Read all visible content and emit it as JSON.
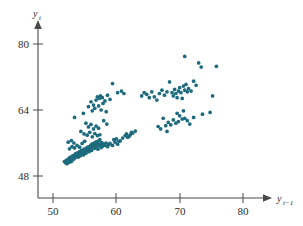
{
  "figure": {
    "background_color": "#ffffff",
    "marker_color": "#1d6b7d",
    "axis_color": "#4a4a4a",
    "text_color": "#2b2b2b"
  },
  "axes": {
    "y_title_base": "y",
    "y_title_sub": "t",
    "x_title_base": "y",
    "x_title_sub": "t−1",
    "x_ticks": [
      "50",
      "60",
      "70",
      "80"
    ],
    "y_ticks": [
      "80",
      "64",
      "48"
    ]
  },
  "chart_data": {
    "type": "scatter",
    "title": "",
    "xlabel": "y_{t-1}",
    "ylabel": "y_t",
    "xlim": [
      46,
      84
    ],
    "ylim": [
      42,
      84
    ],
    "xticks": [
      50,
      60,
      70,
      80
    ],
    "yticks": [
      48,
      64,
      80
    ],
    "grid": false,
    "legend": null,
    "marker_color": "#1d6b7d",
    "marker_size": 3,
    "n_points": 175,
    "series": [
      {
        "name": "lag-1 scatter",
        "points": [
          [
            51.8,
            51.5
          ],
          [
            52.0,
            51.2
          ],
          [
            52.1,
            51.8
          ],
          [
            52.2,
            51.0
          ],
          [
            52.3,
            51.6
          ],
          [
            52.4,
            52.1
          ],
          [
            52.5,
            51.3
          ],
          [
            52.6,
            52.4
          ],
          [
            52.7,
            51.9
          ],
          [
            52.8,
            52.6
          ],
          [
            52.9,
            51.5
          ],
          [
            53.0,
            52.2
          ],
          [
            53.1,
            52.9
          ],
          [
            53.2,
            52.0
          ],
          [
            53.3,
            52.7
          ],
          [
            53.4,
            53.1
          ],
          [
            53.5,
            52.4
          ],
          [
            53.6,
            53.4
          ],
          [
            53.7,
            52.8
          ],
          [
            53.8,
            53.0
          ],
          [
            53.9,
            53.6
          ],
          [
            54.0,
            52.6
          ],
          [
            54.1,
            53.3
          ],
          [
            54.2,
            53.9
          ],
          [
            54.3,
            52.9
          ],
          [
            54.4,
            53.7
          ],
          [
            54.5,
            54.2
          ],
          [
            54.6,
            53.4
          ],
          [
            54.7,
            54.0
          ],
          [
            54.8,
            53.1
          ],
          [
            54.9,
            54.5
          ],
          [
            55.0,
            53.8
          ],
          [
            55.1,
            54.3
          ],
          [
            55.2,
            53.5
          ],
          [
            55.3,
            54.8
          ],
          [
            55.4,
            54.1
          ],
          [
            55.5,
            55.0
          ],
          [
            55.6,
            54.4
          ],
          [
            55.7,
            53.9
          ],
          [
            55.8,
            55.2
          ],
          [
            55.9,
            54.6
          ],
          [
            56.0,
            55.5
          ],
          [
            56.1,
            54.2
          ],
          [
            56.2,
            55.8
          ],
          [
            56.3,
            54.9
          ],
          [
            56.4,
            55.3
          ],
          [
            56.5,
            56.0
          ],
          [
            56.6,
            54.7
          ],
          [
            56.7,
            55.6
          ],
          [
            56.8,
            56.3
          ],
          [
            56.9,
            55.1
          ],
          [
            57.0,
            55.9
          ],
          [
            57.1,
            54.5
          ],
          [
            57.2,
            56.5
          ],
          [
            57.3,
            55.4
          ],
          [
            57.4,
            56.8
          ],
          [
            57.5,
            55.7
          ],
          [
            57.6,
            54.9
          ],
          [
            57.7,
            56.1
          ],
          [
            57.8,
            55.2
          ],
          [
            58.0,
            55.8
          ],
          [
            58.2,
            55.4
          ],
          [
            58.4,
            56.0
          ],
          [
            58.6,
            55.1
          ],
          [
            58.8,
            55.6
          ],
          [
            52.6,
            54.6
          ],
          [
            53.0,
            55.1
          ],
          [
            53.4,
            54.8
          ],
          [
            53.8,
            55.4
          ],
          [
            54.2,
            55.0
          ],
          [
            52.4,
            56.2
          ],
          [
            52.9,
            56.6
          ],
          [
            53.3,
            56.0
          ],
          [
            54.6,
            55.9
          ],
          [
            55.0,
            56.4
          ],
          [
            54.4,
            58.8
          ],
          [
            54.9,
            58.2
          ],
          [
            55.4,
            57.9
          ],
          [
            55.8,
            58.6
          ],
          [
            56.2,
            57.5
          ],
          [
            56.6,
            58.3
          ],
          [
            57.0,
            57.8
          ],
          [
            53.4,
            62.2
          ],
          [
            55.6,
            59.9
          ],
          [
            56.0,
            60.5
          ],
          [
            56.4,
            59.4
          ],
          [
            56.8,
            60.1
          ],
          [
            57.2,
            59.6
          ],
          [
            55.2,
            60.8
          ],
          [
            57.4,
            58.0
          ],
          [
            54.8,
            63.2
          ],
          [
            55.6,
            64.8
          ],
          [
            56.0,
            66.0
          ],
          [
            56.4,
            65.2
          ],
          [
            56.8,
            66.4
          ],
          [
            57.0,
            67.2
          ],
          [
            57.3,
            66.8
          ],
          [
            57.5,
            67.4
          ],
          [
            57.8,
            67.0
          ],
          [
            56.2,
            63.8
          ],
          [
            56.6,
            64.4
          ],
          [
            57.2,
            65.0
          ],
          [
            57.6,
            64.0
          ],
          [
            57.9,
            65.6
          ],
          [
            58.2,
            66.2
          ],
          [
            58.4,
            63.6
          ],
          [
            58.6,
            67.6
          ],
          [
            59.0,
            66.6
          ],
          [
            59.4,
            70.4
          ],
          [
            60.2,
            68.2
          ],
          [
            60.8,
            68.6
          ],
          [
            61.2,
            68.0
          ],
          [
            58.0,
            61.4
          ],
          [
            58.5,
            60.6
          ],
          [
            59.0,
            55.9
          ],
          [
            59.4,
            55.4
          ],
          [
            59.8,
            56.2
          ],
          [
            60.2,
            55.7
          ],
          [
            60.6,
            56.5
          ],
          [
            61.0,
            57.2
          ],
          [
            61.4,
            57.8
          ],
          [
            61.8,
            57.4
          ],
          [
            62.2,
            58.0
          ],
          [
            62.6,
            58.4
          ],
          [
            63.0,
            58.9
          ],
          [
            59.6,
            56.8
          ],
          [
            60.0,
            57.0
          ],
          [
            60.4,
            56.4
          ],
          [
            61.6,
            58.2
          ],
          [
            62.0,
            57.6
          ],
          [
            62.4,
            58.6
          ],
          [
            64.0,
            67.4
          ],
          [
            64.4,
            68.2
          ],
          [
            64.8,
            67.8
          ],
          [
            65.2,
            67.0
          ],
          [
            65.6,
            68.4
          ],
          [
            66.0,
            67.2
          ],
          [
            66.4,
            66.4
          ],
          [
            66.8,
            68.0
          ],
          [
            67.2,
            68.8
          ],
          [
            67.6,
            67.6
          ],
          [
            68.0,
            68.4
          ],
          [
            68.4,
            70.8
          ],
          [
            68.8,
            68.2
          ],
          [
            69.0,
            67.4
          ],
          [
            69.2,
            69.0
          ],
          [
            69.4,
            68.0
          ],
          [
            69.6,
            67.0
          ],
          [
            69.8,
            68.6
          ],
          [
            70.0,
            69.4
          ],
          [
            70.2,
            68.2
          ],
          [
            70.4,
            66.8
          ],
          [
            70.6,
            69.8
          ],
          [
            70.8,
            68.8
          ],
          [
            71.0,
            70.2
          ],
          [
            71.2,
            68.4
          ],
          [
            71.4,
            69.2
          ],
          [
            71.8,
            68.6
          ],
          [
            72.2,
            71.0
          ],
          [
            72.6,
            70.0
          ],
          [
            73.4,
            74.4
          ],
          [
            70.8,
            77.0
          ],
          [
            73.0,
            75.4
          ],
          [
            75.8,
            74.6
          ],
          [
            75.2,
            67.4
          ],
          [
            67.0,
            59.4
          ],
          [
            67.4,
            62.0
          ],
          [
            67.8,
            60.2
          ],
          [
            68.2,
            61.0
          ],
          [
            68.6,
            60.4
          ],
          [
            69.0,
            61.6
          ],
          [
            69.4,
            60.8
          ],
          [
            69.8,
            61.2
          ],
          [
            70.0,
            62.6
          ],
          [
            70.4,
            61.8
          ],
          [
            70.8,
            62.0
          ],
          [
            71.2,
            61.4
          ],
          [
            72.2,
            62.2
          ],
          [
            73.6,
            63.0
          ],
          [
            74.8,
            63.4
          ],
          [
            68.0,
            58.8
          ],
          [
            66.6,
            60.0
          ],
          [
            71.6,
            60.6
          ],
          [
            69.6,
            63.2
          ],
          [
            70.6,
            63.8
          ]
        ]
      }
    ]
  }
}
